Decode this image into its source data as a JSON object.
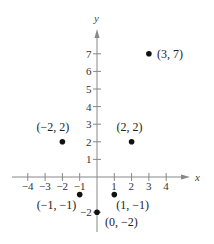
{
  "chart_data": {
    "type": "scatter",
    "title": "",
    "xlabel": "x",
    "ylabel": "y",
    "xlim": [
      -4.5,
      5
    ],
    "ylim": [
      -2.8,
      8
    ],
    "x_ticks": [
      -4,
      -3,
      -2,
      -1,
      1,
      2,
      3,
      4
    ],
    "y_ticks": [
      -2,
      1,
      2,
      3,
      4,
      5,
      6,
      7
    ],
    "grid": false,
    "legend": null,
    "points": [
      {
        "x": 3,
        "y": 7,
        "label": "(3, 7)"
      },
      {
        "x": -2,
        "y": 2,
        "label": "(−2, 2)"
      },
      {
        "x": 2,
        "y": 2,
        "label": "(2, 2)"
      },
      {
        "x": -1,
        "y": -1,
        "label": "(−1, −1)"
      },
      {
        "x": 1,
        "y": -1,
        "label": "(1, −1)"
      },
      {
        "x": 0,
        "y": -2,
        "label": "(0, −2)"
      }
    ]
  },
  "colors": {
    "axis": "#888888",
    "point": "#111111",
    "text": "#222222"
  }
}
